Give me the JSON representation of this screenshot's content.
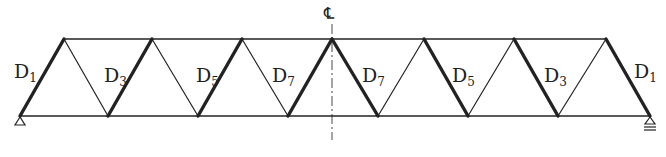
{
  "diagram": {
    "type": "warren-truss",
    "centerline_label": "℄",
    "chords": {
      "top": {
        "x1": 64,
        "x2": 606,
        "y": 39
      },
      "bottom": {
        "x1": 20,
        "x2": 650,
        "y": 116
      }
    },
    "top_nodes_x": [
      64,
      152,
      242,
      332,
      424,
      514,
      606
    ],
    "bottom_nodes_x": [
      20,
      108,
      198,
      288,
      378,
      468,
      558,
      650
    ],
    "diagonals": [
      {
        "from": [
          20,
          116
        ],
        "to": [
          64,
          39
        ],
        "heavy": true,
        "label": "D",
        "sub": "1",
        "lx": 14,
        "ly": 62
      },
      {
        "from": [
          64,
          39
        ],
        "to": [
          108,
          116
        ],
        "heavy": false
      },
      {
        "from": [
          108,
          116
        ],
        "to": [
          152,
          39
        ],
        "heavy": true,
        "label": "D",
        "sub": "3",
        "lx": 104,
        "ly": 66
      },
      {
        "from": [
          152,
          39
        ],
        "to": [
          198,
          116
        ],
        "heavy": false
      },
      {
        "from": [
          198,
          116
        ],
        "to": [
          242,
          39
        ],
        "heavy": true,
        "label": "D",
        "sub": "5",
        "lx": 196,
        "ly": 66
      },
      {
        "from": [
          242,
          39
        ],
        "to": [
          288,
          116
        ],
        "heavy": false,
        "label": "D",
        "sub": "7",
        "lx": 272,
        "ly": 66
      },
      {
        "from": [
          288,
          116
        ],
        "to": [
          332,
          39
        ],
        "heavy": true
      },
      {
        "from": [
          332,
          39
        ],
        "to": [
          378,
          116
        ],
        "heavy": true,
        "label": "D",
        "sub": "7",
        "lx": 362,
        "ly": 66
      },
      {
        "from": [
          378,
          116
        ],
        "to": [
          424,
          39
        ],
        "heavy": false
      },
      {
        "from": [
          424,
          39
        ],
        "to": [
          468,
          116
        ],
        "heavy": true,
        "label": "D",
        "sub": "5",
        "lx": 452,
        "ly": 66
      },
      {
        "from": [
          468,
          116
        ],
        "to": [
          514,
          39
        ],
        "heavy": false
      },
      {
        "from": [
          514,
          39
        ],
        "to": [
          558,
          116
        ],
        "heavy": true,
        "label": "D",
        "sub": "3",
        "lx": 544,
        "ly": 66
      },
      {
        "from": [
          558,
          116
        ],
        "to": [
          606,
          39
        ],
        "heavy": false
      },
      {
        "from": [
          606,
          39
        ],
        "to": [
          650,
          116
        ],
        "heavy": true,
        "label": "D",
        "sub": "1",
        "lx": 634,
        "ly": 62
      }
    ],
    "supports": {
      "left": "pin",
      "right": "roller"
    },
    "colors": {
      "line": "#222222",
      "background": "#ffffff"
    }
  }
}
